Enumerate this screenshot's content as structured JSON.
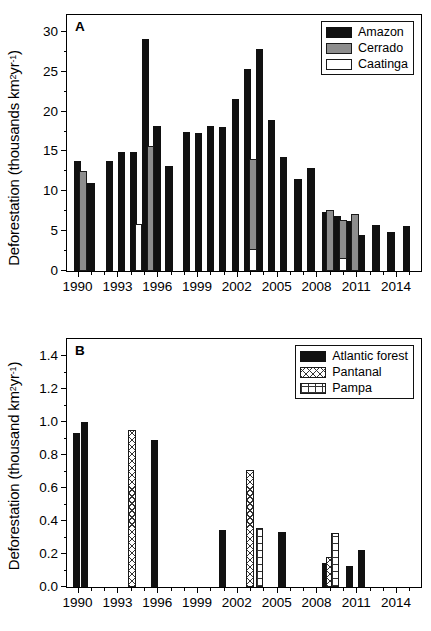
{
  "figure": {
    "panels": [
      "A",
      "B"
    ]
  },
  "panel_a": {
    "letter": "A",
    "ylabel_pre": "Deforestation (thousands km",
    "ylabel_sup1": "2",
    "ylabel_mid": " yr",
    "ylabel_sup2": "-1",
    "ylabel_post": ")",
    "legend": [
      {
        "label": "Amazon",
        "style": "black"
      },
      {
        "label": "Cerrado",
        "style": "gray"
      },
      {
        "label": "Caatinga",
        "style": "white"
      }
    ]
  },
  "panel_b": {
    "letter": "B",
    "ylabel_pre": "Deforestation (thousand km",
    "ylabel_sup1": "2",
    "ylabel_mid": " yr",
    "ylabel_sup2": "-1",
    "ylabel_post": ")",
    "legend": [
      {
        "label": "Atlantic forest",
        "style": "black"
      },
      {
        "label": "Pantanal",
        "style": "cross"
      },
      {
        "label": "Pampa",
        "style": "grid"
      }
    ]
  },
  "chart_data": [
    {
      "type": "bar",
      "panel": "A",
      "title": "A",
      "xlabel": "",
      "ylabel": "Deforestation (thousands km2 yr-1)",
      "ylim": [
        0,
        32
      ],
      "yticks": [
        0,
        5,
        10,
        15,
        20,
        25,
        30
      ],
      "ytick_labels": [
        "0",
        "5",
        "10",
        "15",
        "20",
        "25",
        "30"
      ],
      "xlim": [
        1989.2,
        2015.8
      ],
      "xticks": [
        1990,
        1993,
        1996,
        1999,
        2002,
        2005,
        2008,
        2011,
        2014
      ],
      "xtick_labels": [
        "1990",
        "1993",
        "1996",
        "1999",
        "2002",
        "2005",
        "2008",
        "2011",
        "2014"
      ],
      "grid": false,
      "legend_position": "top-right",
      "categories": [
        1990,
        1991,
        1992,
        1993,
        1994,
        1995,
        1996,
        1997,
        1998,
        1999,
        2000,
        2001,
        2002,
        2003,
        2004,
        2005,
        2006,
        2007,
        2008,
        2009,
        2010,
        2011,
        2012,
        2013,
        2014,
        2015
      ],
      "series": [
        {
          "name": "Amazon",
          "style": "black",
          "points": [
            {
              "x": 1990.0,
              "y": 13.8
            },
            {
              "x": 1991.0,
              "y": 11.1
            },
            {
              "x": 1992.4,
              "y": 13.8
            },
            {
              "x": 1993.3,
              "y": 14.9
            },
            {
              "x": 1994.2,
              "y": 14.9
            },
            {
              "x": 1995.1,
              "y": 29.1
            },
            {
              "x": 1996.0,
              "y": 18.2
            },
            {
              "x": 1996.9,
              "y": 13.2
            },
            {
              "x": 1998.2,
              "y": 17.4
            },
            {
              "x": 1999.1,
              "y": 17.3
            },
            {
              "x": 2000.0,
              "y": 18.2
            },
            {
              "x": 2000.9,
              "y": 18.1
            },
            {
              "x": 2001.9,
              "y": 21.6
            },
            {
              "x": 2002.8,
              "y": 25.4
            },
            {
              "x": 2003.7,
              "y": 27.8
            },
            {
              "x": 2004.6,
              "y": 19.0
            },
            {
              "x": 2005.5,
              "y": 14.3
            },
            {
              "x": 2006.6,
              "y": 11.6
            },
            {
              "x": 2007.6,
              "y": 12.9
            },
            {
              "x": 2008.7,
              "y": 7.4
            },
            {
              "x": 2009.6,
              "y": 6.9
            },
            {
              "x": 2010.5,
              "y": 6.3
            },
            {
              "x": 2011.4,
              "y": 4.5
            },
            {
              "x": 2012.5,
              "y": 5.8
            },
            {
              "x": 2013.6,
              "y": 4.9
            },
            {
              "x": 2014.8,
              "y": 5.7
            }
          ]
        },
        {
          "name": "Cerrado",
          "style": "gray",
          "points": [
            {
              "x": 1990.4,
              "y": 12.6
            },
            {
              "x": 1995.5,
              "y": 15.7
            },
            {
              "x": 2003.2,
              "y": 14.1
            },
            {
              "x": 2009.0,
              "y": 7.6
            },
            {
              "x": 2010.0,
              "y": 6.4
            },
            {
              "x": 2010.9,
              "y": 7.1
            }
          ]
        },
        {
          "name": "Caatinga",
          "style": "white",
          "points": [
            {
              "x": 1994.6,
              "y": 5.9
            },
            {
              "x": 2003.2,
              "y": 2.7
            },
            {
              "x": 2010.0,
              "y": 1.6
            }
          ]
        }
      ]
    },
    {
      "type": "bar",
      "panel": "B",
      "title": "B",
      "xlabel": "",
      "ylabel": "Deforestation (thousand km2 yr-1)",
      "ylim": [
        0.0,
        1.5
      ],
      "yticks": [
        0.0,
        0.2,
        0.4,
        0.6,
        0.8,
        1.0,
        1.2,
        1.4
      ],
      "ytick_labels": [
        "0.0",
        "0.2",
        "0.4",
        "0.6",
        "0.8",
        "1.0",
        "1.2",
        "1.4"
      ],
      "xlim": [
        1989.2,
        2015.8
      ],
      "xticks": [
        1990,
        1993,
        1996,
        1999,
        2002,
        2005,
        2008,
        2011,
        2014
      ],
      "xtick_labels": [
        "1990",
        "1993",
        "1996",
        "1999",
        "2002",
        "2005",
        "2008",
        "2011",
        "2014"
      ],
      "grid": false,
      "legend_position": "top-right",
      "series": [
        {
          "name": "Atlantic forest",
          "style": "black",
          "points": [
            {
              "x": 1989.9,
              "y": 0.935
            },
            {
              "x": 1990.5,
              "y": 1.0
            },
            {
              "x": 1995.8,
              "y": 0.89
            },
            {
              "x": 2000.9,
              "y": 0.345
            },
            {
              "x": 2005.4,
              "y": 0.335
            },
            {
              "x": 2008.7,
              "y": 0.145
            },
            {
              "x": 2010.5,
              "y": 0.125
            },
            {
              "x": 2011.4,
              "y": 0.225
            }
          ]
        },
        {
          "name": "Pantanal",
          "style": "cross",
          "points": [
            {
              "x": 1994.1,
              "y": 0.955
            },
            {
              "x": 2003.0,
              "y": 0.71
            },
            {
              "x": 2009.0,
              "y": 0.185
            }
          ]
        },
        {
          "name": "Pampa",
          "style": "grid",
          "points": [
            {
              "x": 2003.7,
              "y": 0.36
            },
            {
              "x": 2009.4,
              "y": 0.325
            }
          ]
        }
      ]
    }
  ]
}
